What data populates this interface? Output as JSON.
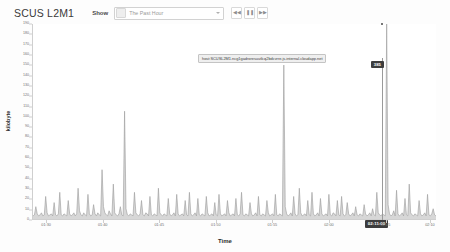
{
  "header": {
    "title": "SCUS L2M1",
    "show_label": "Show",
    "calendar_icon": "calendar-icon",
    "range_value": "The Past Hour",
    "range_options": [
      "The Past Hour",
      "The Past 4 Hours",
      "The Past Day",
      "The Past Week"
    ],
    "buttons": [
      {
        "name": "step-back-button",
        "glyph": "◀◀"
      },
      {
        "name": "pause-button",
        "glyph": "❚❚"
      },
      {
        "name": "step-forward-button",
        "glyph": "▶▶"
      }
    ]
  },
  "tooltip": {
    "text": "host:SCUSL2M1.ncg1gadroresuutlcq2bdcvrre.js.internal.cloudapp.net",
    "value": "385",
    "time": "02:11:00"
  },
  "chart_data": {
    "type": "area",
    "title": "",
    "xlabel": "Time",
    "ylabel": "kilobyte",
    "grid": false,
    "legend": "none",
    "ylim": [
      0,
      190
    ],
    "yticks": [
      0,
      10,
      20,
      30,
      40,
      50,
      60,
      70,
      80,
      90,
      100,
      110,
      120,
      130,
      140,
      150,
      160,
      170,
      180,
      190
    ],
    "xticks": [
      "01:30",
      "01:40",
      "01:45",
      "01:50",
      "01:55",
      "02:00",
      "02:05",
      "02:10"
    ],
    "xtick_positions": [
      0.035,
      0.175,
      0.315,
      0.455,
      0.595,
      0.735,
      0.875,
      0.985
    ],
    "series": [
      {
        "name": "host:SCUSL2M1",
        "color": "#9a9a9a",
        "fill": "#c9c9c9",
        "values": [
          3,
          4,
          12,
          5,
          3,
          4,
          6,
          3,
          4,
          22,
          6,
          3,
          4,
          5,
          3,
          16,
          4,
          3,
          5,
          26,
          4,
          3,
          5,
          4,
          3,
          18,
          5,
          3,
          4,
          6,
          3,
          5,
          30,
          8,
          4,
          3,
          6,
          4,
          3,
          24,
          5,
          3,
          4,
          14,
          5,
          3,
          6,
          4,
          3,
          48,
          12,
          6,
          4,
          3,
          8,
          5,
          3,
          34,
          6,
          4,
          3,
          5,
          12,
          4,
          3,
          105,
          10,
          4,
          3,
          5,
          4,
          3,
          26,
          6,
          4,
          3,
          5,
          18,
          4,
          3,
          6,
          5,
          3,
          22,
          4,
          3,
          5,
          4,
          3,
          30,
          6,
          4,
          3,
          5,
          4,
          3,
          20,
          5,
          3,
          4,
          6,
          3,
          24,
          5,
          3,
          4,
          5,
          3,
          18,
          4,
          3,
          26,
          5,
          3,
          4,
          6,
          3,
          20,
          4,
          3,
          5,
          4,
          3,
          22,
          6,
          3,
          4,
          5,
          3,
          16,
          4,
          3,
          24,
          5,
          3,
          4,
          5,
          3,
          18,
          6,
          3,
          4,
          5,
          3,
          20,
          4,
          3,
          5,
          26,
          4,
          3,
          5,
          4,
          3,
          16,
          5,
          3,
          4,
          6,
          3,
          22,
          4,
          3,
          5,
          4,
          3,
          18,
          6,
          3,
          4,
          5,
          3,
          24,
          4,
          3,
          5,
          4,
          3,
          150,
          12,
          5,
          3,
          4,
          6,
          3,
          22,
          5,
          3,
          4,
          30,
          6,
          3,
          4,
          5,
          3,
          18,
          4,
          3,
          26,
          5,
          3,
          4,
          6,
          3,
          20,
          5,
          3,
          4,
          5,
          3,
          24,
          4,
          3,
          6,
          5,
          3,
          18,
          4,
          3,
          22,
          5,
          3,
          4,
          16,
          5,
          3,
          4,
          6,
          3,
          12,
          4,
          3,
          5,
          4,
          3,
          14,
          5,
          3,
          4,
          6,
          3,
          10,
          4,
          3,
          26,
          6,
          4,
          3,
          5,
          4,
          3,
          190,
          14,
          5,
          3,
          4,
          8,
          3,
          28,
          5,
          3,
          4,
          6,
          3,
          20,
          4,
          3,
          34,
          6,
          4,
          3,
          5,
          4,
          3,
          18,
          5,
          3,
          4,
          6,
          3,
          24,
          4,
          3,
          5,
          10,
          4,
          3
        ]
      }
    ],
    "cursor_x_fraction": 0.866,
    "highlight_value": 190
  }
}
